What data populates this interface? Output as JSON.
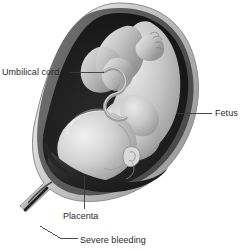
{
  "figure": {
    "style": "grayscale medical illustration",
    "background_color": "#ffffff",
    "width": 251,
    "height": 251
  },
  "labels": [
    {
      "id": "umbilical-cord",
      "text": "Umbilical cord",
      "position": "left",
      "leader_line": {
        "from_x": 70,
        "from_y": 72,
        "to_x": 104,
        "to_y": 72
      }
    },
    {
      "id": "fetus",
      "text": "Fetus",
      "position": "right",
      "leader_line": {
        "from_x": 176,
        "from_y": 113,
        "to_x": 212,
        "to_y": 113
      }
    },
    {
      "id": "placenta",
      "text": "Placenta",
      "position": "bottom-center",
      "leader_line": {
        "from_x": 84,
        "from_y": 175,
        "to_x": 84,
        "to_y": 209
      }
    },
    {
      "id": "severe-bleeding",
      "text": "Severe bleeding",
      "position": "bottom",
      "leader_line": {
        "from_x": 40,
        "from_y": 226,
        "to_x": 78,
        "to_y": 240
      }
    }
  ],
  "anatomy": {
    "uterus": {
      "name": "uterus",
      "description": "pear-shaped uterus tilted with fundus upper-right and cervix lower-left",
      "outer_wall_color": "#b9b9b9",
      "wall_highlight_color": "#dedede",
      "inner_wall_color": "#6e6e6e",
      "cavity_color": "#1c1c1c"
    },
    "fetus": {
      "name": "fetus",
      "description": "full-term fetus in head-down vertex presentation, head at lower left, legs flexed at top",
      "skin_light": "#e8e8e8",
      "skin_mid": "#bdbdbd",
      "skin_shadow": "#8a8a8a"
    },
    "placenta": {
      "name": "placenta",
      "description": "dark placental mass lying low across the lower uterine segment covering the cervical os",
      "color": "#2a2a2a"
    },
    "umbilical_cord": {
      "name": "umbilical-cord",
      "description": "coiled umbilical cord running from placenta to fetal abdomen",
      "color": "#9a9a9a"
    },
    "cervix": {
      "name": "cervix",
      "description": "narrow cervical canal extending to the lower left, site of severe bleeding",
      "color": "#232323"
    }
  },
  "colors": {
    "label_text": "#2b2b2b",
    "leader_line": "#3a3a3a",
    "background": "#ffffff"
  }
}
